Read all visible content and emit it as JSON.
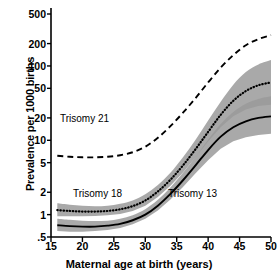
{
  "chart_data": {
    "type": "line",
    "title": "",
    "xlabel": "Maternal age at birth (years)",
    "ylabel": "Prevalence per 1000 births",
    "xlim": [
      15,
      50
    ],
    "ylim": [
      0.5,
      500
    ],
    "yscale": "log",
    "xscale": "linear",
    "grid": false,
    "legend_position": "inline-annotations",
    "xticks": [
      "15",
      "20",
      "25",
      "30",
      "35",
      "40",
      "45",
      "50"
    ],
    "xtick_values": [
      15,
      20,
      25,
      30,
      35,
      40,
      45,
      50
    ],
    "yticks": [
      "500",
      "200",
      "100",
      "50",
      "20",
      "10",
      "5",
      "2",
      "1",
      ".5"
    ],
    "ytick_values": [
      500,
      200,
      100,
      50,
      20,
      10,
      5,
      2,
      1,
      0.5
    ],
    "x": [
      16,
      18,
      20,
      22,
      24,
      26,
      28,
      30,
      32,
      34,
      36,
      38,
      40,
      42,
      44,
      46,
      48,
      50
    ],
    "series": [
      {
        "name": "Trisomy 21",
        "style": "dashed",
        "color": "#000000",
        "band": false,
        "values": [
          6.2,
          6.0,
          5.9,
          5.9,
          6.0,
          6.3,
          6.9,
          8.2,
          10.8,
          15.5,
          23.5,
          37.0,
          60.0,
          95.0,
          140.0,
          190.0,
          230.0,
          260.0
        ]
      },
      {
        "name": "Trisomy 18",
        "style": "dotted",
        "color": "#000000",
        "band": true,
        "band_color": "#9a9a9a",
        "values": [
          1.15,
          1.12,
          1.1,
          1.1,
          1.12,
          1.18,
          1.3,
          1.55,
          2.05,
          2.95,
          4.6,
          7.6,
          13.0,
          22.0,
          34.0,
          46.0,
          55.0,
          60.0
        ],
        "band_low": [
          0.95,
          0.95,
          0.95,
          0.96,
          0.98,
          1.02,
          1.12,
          1.32,
          1.72,
          2.45,
          3.7,
          5.9,
          9.6,
          15.0,
          21.0,
          26.0,
          29.0,
          30.0
        ],
        "band_high": [
          1.42,
          1.36,
          1.32,
          1.3,
          1.32,
          1.4,
          1.55,
          1.88,
          2.5,
          3.65,
          5.9,
          10.2,
          18.5,
          33.0,
          56.0,
          83.0,
          105.0,
          120.0
        ]
      },
      {
        "name": "Trisomy 13",
        "style": "solid",
        "color": "#000000",
        "band": true,
        "band_color": "#9a9a9a",
        "values": [
          0.72,
          0.7,
          0.69,
          0.69,
          0.71,
          0.75,
          0.84,
          1.0,
          1.32,
          1.9,
          2.9,
          4.6,
          7.4,
          11.2,
          15.0,
          18.0,
          20.0,
          21.0
        ],
        "band_low": [
          0.6,
          0.59,
          0.59,
          0.6,
          0.62,
          0.66,
          0.74,
          0.88,
          1.14,
          1.6,
          2.35,
          3.6,
          5.4,
          7.7,
          9.7,
          11.0,
          11.8,
          12.2
        ],
        "band_high": [
          0.88,
          0.85,
          0.83,
          0.82,
          0.83,
          0.88,
          0.98,
          1.18,
          1.58,
          2.32,
          3.65,
          6.0,
          10.2,
          16.5,
          24.0,
          31.0,
          36.0,
          39.0
        ]
      }
    ],
    "annotations": [
      {
        "text": "Trisomy 21",
        "x": 21,
        "y": 22
      },
      {
        "text": "Trisomy 18",
        "x": 24,
        "y": 2.6
      },
      {
        "text": "Trisomy 13",
        "x": 38,
        "y": 2.6
      }
    ]
  },
  "axes": {
    "y_title": "Prevalence per 1000 births",
    "x_title": "Maternal age at birth (years)",
    "y_tick_labels": [
      "500",
      "200",
      "100",
      "50",
      "20",
      "10",
      "5",
      "2",
      "1",
      ".5"
    ],
    "x_tick_labels": [
      "15",
      "20",
      "25",
      "30",
      "35",
      "40",
      "45",
      "50"
    ]
  },
  "annotations": {
    "trisomy21": "Trisomy 21",
    "trisomy18": "Trisomy 18",
    "trisomy13": "Trisomy 13"
  },
  "colors": {
    "axis": "#000000",
    "curve": "#000000",
    "band": "#9a9a9a",
    "background": "#ffffff"
  }
}
